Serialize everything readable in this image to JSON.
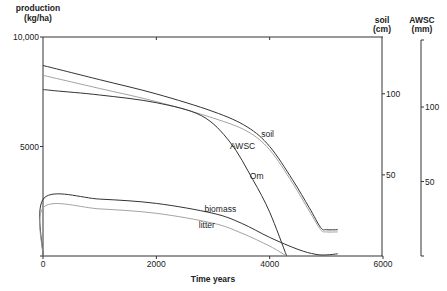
{
  "chart_data": {
    "type": "line",
    "title": "",
    "xlabel": "Time years",
    "ylabel": "production\n(kg/ha)",
    "ylabel_lines": [
      "production",
      "(kg/ha)"
    ],
    "xlim": [
      0,
      6000
    ],
    "ylim": [
      0,
      10000
    ],
    "x_ticks": [
      0,
      2000,
      4000,
      6000
    ],
    "x_tick_labels": [
      "0",
      "2000",
      "4000",
      "6000"
    ],
    "y_ticks": [
      0,
      5000,
      10000
    ],
    "y_tick_labels": [
      "",
      "5000",
      "10,000"
    ],
    "grid": false,
    "secondary_axes": [
      {
        "name": "soil",
        "label_lines": [
          "soil",
          "(cm)"
        ],
        "ylim": [
          0,
          135
        ],
        "ticks": [
          50,
          100
        ],
        "tick_labels": [
          "50",
          "100"
        ]
      },
      {
        "name": "AWSC",
        "label_lines": [
          "AWSC",
          "(mm)"
        ],
        "ylim": [
          0,
          145
        ],
        "ticks": [
          50,
          100
        ],
        "tick_labels": [
          "50",
          "100"
        ]
      }
    ],
    "series": [
      {
        "name": "soil",
        "style": "dark",
        "axis": "production-equivalent",
        "x": [
          0,
          1000,
          2000,
          3000,
          3600,
          4000,
          4400,
          4700,
          4900,
          5000,
          5200
        ],
        "values": [
          8700,
          8050,
          7400,
          6600,
          5900,
          5000,
          3500,
          2200,
          1300,
          1200,
          1200
        ]
      },
      {
        "name": "AWSC",
        "style": "light",
        "axis": "production-equivalent",
        "x": [
          0,
          1000,
          2000,
          3000,
          3600,
          4000,
          4400,
          4700,
          4900,
          5000,
          5200
        ],
        "values": [
          8250,
          7650,
          7050,
          6300,
          5700,
          4850,
          3350,
          2050,
          1200,
          1100,
          1100
        ]
      },
      {
        "name": "Om",
        "style": "dark",
        "axis": "production",
        "x": [
          0,
          200,
          1000,
          2000,
          2800,
          3300,
          3700,
          4000,
          4300
        ],
        "values": [
          7600,
          7550,
          7350,
          7000,
          6400,
          5200,
          3500,
          2000,
          0
        ]
      },
      {
        "name": "biomass",
        "style": "dark",
        "axis": "production",
        "x": [
          0,
          20,
          1000,
          2000,
          3000,
          3500,
          4000,
          4500,
          4800,
          5000,
          5200
        ],
        "values": [
          0,
          2650,
          2600,
          2400,
          1950,
          1500,
          850,
          300,
          80,
          50,
          100
        ]
      },
      {
        "name": "litter",
        "style": "light",
        "axis": "production",
        "x": [
          0,
          20,
          1000,
          2000,
          3000,
          3500,
          4000,
          4300
        ],
        "values": [
          0,
          2250,
          2150,
          1950,
          1500,
          1050,
          450,
          0
        ]
      }
    ],
    "annotations": [
      {
        "text": "soil",
        "x": 3850,
        "y": 5420
      },
      {
        "text": "AWSC",
        "x": 3300,
        "y": 4900
      },
      {
        "text": "Om",
        "x": 3650,
        "y": 3500
      },
      {
        "text": "biomass",
        "x": 2850,
        "y": 2000
      },
      {
        "text": "litter",
        "x": 2750,
        "y": 1270
      }
    ],
    "legend": "none"
  }
}
